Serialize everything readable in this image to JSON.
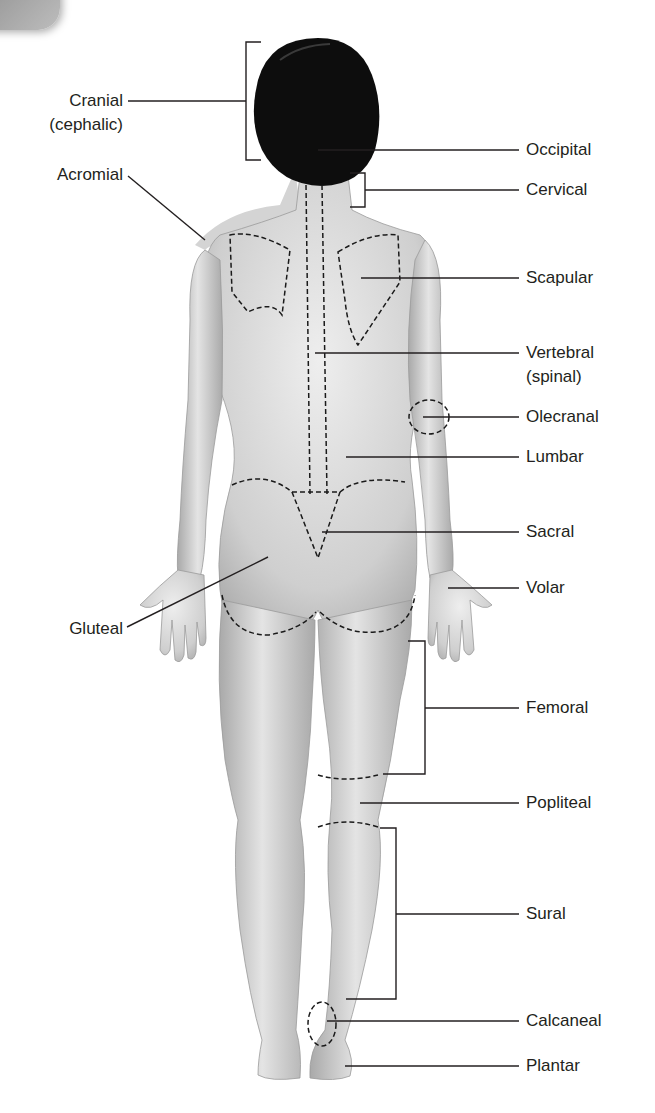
{
  "diagram": {
    "colors": {
      "line": "#231f20",
      "skin": "#c9c9c9",
      "hair": "#0d0d0d",
      "dash": "#1a1a1a"
    },
    "labels_left": [
      {
        "id": "cranial",
        "line1": "Cranial",
        "line2": "(cephalic)"
      },
      {
        "id": "acromial",
        "line1": "Acromial"
      },
      {
        "id": "gluteal",
        "line1": "Gluteal"
      }
    ],
    "labels_right": [
      {
        "id": "occipital",
        "line1": "Occipital"
      },
      {
        "id": "cervical",
        "line1": "Cervical"
      },
      {
        "id": "scapular",
        "line1": "Scapular"
      },
      {
        "id": "vertebral",
        "line1": "Vertebral",
        "line2": "(spinal)"
      },
      {
        "id": "olecranal",
        "line1": "Olecranal"
      },
      {
        "id": "lumbar",
        "line1": "Lumbar"
      },
      {
        "id": "sacral",
        "line1": "Sacral"
      },
      {
        "id": "volar",
        "line1": "Volar"
      },
      {
        "id": "femoral",
        "line1": "Femoral"
      },
      {
        "id": "popliteal",
        "line1": "Popliteal"
      },
      {
        "id": "sural",
        "line1": "Sural"
      },
      {
        "id": "calcaneal",
        "line1": "Calcaneal"
      },
      {
        "id": "plantar",
        "line1": "Plantar"
      }
    ]
  }
}
